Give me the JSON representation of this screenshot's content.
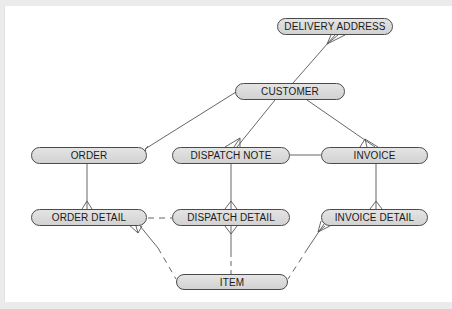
{
  "diagram": {
    "type": "entity-relationship",
    "notation": "crow's foot",
    "colors": {
      "entity_fill": "#d9d9d9",
      "entity_border": "#4a4a4a",
      "line": "#555555",
      "background": "#ffffff",
      "frame": "#ebebeb"
    },
    "entities": [
      {
        "id": "delivery_address",
        "label": "DELIVERY ADDRESS",
        "x": 277,
        "y": 18,
        "w": 116,
        "h": 17
      },
      {
        "id": "customer",
        "label": "CUSTOMER",
        "x": 235,
        "y": 83,
        "w": 110,
        "h": 17
      },
      {
        "id": "order",
        "label": "ORDER",
        "x": 31,
        "y": 147,
        "w": 116,
        "h": 17
      },
      {
        "id": "dispatch_note",
        "label": "DISPATCH NOTE",
        "x": 172,
        "y": 147,
        "w": 118,
        "h": 17
      },
      {
        "id": "invoice",
        "label": "INVOICE",
        "x": 321,
        "y": 147,
        "w": 107,
        "h": 17
      },
      {
        "id": "order_detail",
        "label": "ORDER DETAIL",
        "x": 31,
        "y": 209,
        "w": 116,
        "h": 17
      },
      {
        "id": "dispatch_detail",
        "label": "DISPATCH DETAIL",
        "x": 172,
        "y": 209,
        "w": 118,
        "h": 17
      },
      {
        "id": "invoice_detail",
        "label": "INVOICE DETAIL",
        "x": 321,
        "y": 209,
        "w": 107,
        "h": 17
      },
      {
        "id": "item",
        "label": "ITEM",
        "x": 176,
        "y": 274,
        "w": 112,
        "h": 16
      }
    ],
    "relationships": [
      {
        "from": "delivery_address",
        "to": "customer",
        "many_end": "delivery_address",
        "style": "solid"
      },
      {
        "from": "customer",
        "to": "order",
        "many_end": "order",
        "style": "solid"
      },
      {
        "from": "customer",
        "to": "dispatch_note",
        "many_end": "dispatch_note",
        "style": "solid"
      },
      {
        "from": "customer",
        "to": "invoice",
        "many_end": "invoice",
        "style": "solid"
      },
      {
        "from": "dispatch_note",
        "to": "invoice",
        "many_end": null,
        "style": "solid"
      },
      {
        "from": "order",
        "to": "order_detail",
        "many_end": "order_detail",
        "style": "solid"
      },
      {
        "from": "dispatch_note",
        "to": "dispatch_detail",
        "many_end": "dispatch_detail",
        "style": "solid"
      },
      {
        "from": "invoice",
        "to": "invoice_detail",
        "many_end": "invoice_detail",
        "style": "solid"
      },
      {
        "from": "order_detail",
        "to": "dispatch_detail",
        "many_end": null,
        "style": "dashed"
      },
      {
        "from": "item",
        "to": "order_detail",
        "many_end": "order_detail",
        "style": "dashed/solid"
      },
      {
        "from": "item",
        "to": "dispatch_detail",
        "many_end": "dispatch_detail",
        "style": "dashed/solid"
      },
      {
        "from": "item",
        "to": "invoice_detail",
        "many_end": "invoice_detail",
        "style": "dashed/solid"
      }
    ]
  }
}
